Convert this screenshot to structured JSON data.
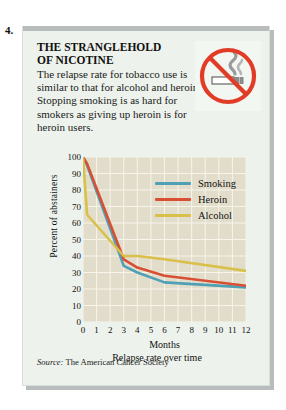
{
  "question_number": "4.",
  "card": {
    "headline_line1": "THE STRANGLEHOLD",
    "headline_line2": "OF NICOTINE",
    "body": "The relapse rate for tobacco use is similar to that for alcohol and heroin. Stopping smoking is as hard for smokers as giving up heroin is for heroin users.",
    "icon": "no-smoking-icon",
    "source_prefix": "Source:",
    "source_text": "The American Cancer Society"
  },
  "colors": {
    "smoking": "#4f9fb5",
    "heroin": "#d94f33",
    "alcohol": "#d9c04a",
    "plot_bg": "#e2ddcb",
    "grid": "#f7f4ea",
    "card_bg": "#edf2ec",
    "shadow": "#b9bcbd",
    "sign_red": "#e23c26"
  },
  "chart_data": {
    "type": "line",
    "title": "",
    "xlabel": "Months",
    "sublabel": "Relapse rate over time",
    "ylabel": "Percent of abstainers",
    "xlim": [
      0,
      12
    ],
    "ylim": [
      0,
      100
    ],
    "grid": true,
    "legend_position": "top-right-inside",
    "xticks": [
      0,
      1,
      2,
      3,
      4,
      5,
      6,
      7,
      8,
      9,
      10,
      11,
      12
    ],
    "yticks": [
      0,
      10,
      20,
      30,
      40,
      50,
      60,
      70,
      80,
      90,
      100
    ],
    "x": [
      0,
      0.3,
      3,
      4,
      6,
      12
    ],
    "series": [
      {
        "name": "Smoking",
        "color": "#4f9fb5",
        "values": [
          100,
          95,
          34,
          30,
          24,
          21
        ]
      },
      {
        "name": "Heroin",
        "color": "#d94f33",
        "values": [
          100,
          96,
          38,
          33,
          28,
          22
        ]
      },
      {
        "name": "Alcohol",
        "color": "#d9c04a",
        "values": [
          100,
          65,
          40,
          40,
          38,
          31
        ]
      }
    ]
  }
}
